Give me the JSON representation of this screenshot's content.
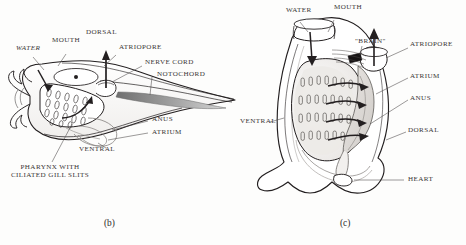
{
  "figure": {
    "panels": [
      {
        "id": "b",
        "caption": "(b)",
        "orientation": "lateral view",
        "labels": [
          {
            "name": "water",
            "text": "WATER",
            "style": "italic"
          },
          {
            "name": "mouth",
            "text": "MOUTH",
            "style": "normal"
          },
          {
            "name": "dorsal",
            "text": "DORSAL",
            "style": "normal"
          },
          {
            "name": "atriopore",
            "text": "ATRIOPORE",
            "style": "normal"
          },
          {
            "name": "nerve-cord",
            "text": "NERVE CORD",
            "style": "normal"
          },
          {
            "name": "notochord",
            "text": "NOTOCHORD",
            "style": "normal"
          },
          {
            "name": "anus",
            "text": "ANUS",
            "style": "normal"
          },
          {
            "name": "atrium",
            "text": "ATRIUM",
            "style": "normal"
          },
          {
            "name": "ventral",
            "text": "VENTRAL",
            "style": "normal"
          },
          {
            "name": "pharynx",
            "text": "PHARYNX WITH CILIATED GILL SLITS",
            "style": "normal"
          }
        ],
        "gill_slit_rows": 4,
        "gill_slits_per_row": 5
      },
      {
        "id": "c",
        "caption": "(c)",
        "orientation": "anterior view",
        "labels": [
          {
            "name": "water",
            "text": "WATER",
            "style": "normal"
          },
          {
            "name": "mouth",
            "text": "MOUTH",
            "style": "normal"
          },
          {
            "name": "brain",
            "text": "\"BRAIN\"",
            "style": "normal"
          },
          {
            "name": "atriopore",
            "text": "ATRIOPORE",
            "style": "normal"
          },
          {
            "name": "atrium",
            "text": "ATRIUM",
            "style": "normal"
          },
          {
            "name": "anus",
            "text": "ANUS",
            "style": "normal"
          },
          {
            "name": "ventral",
            "text": "VENTRAL",
            "style": "normal"
          },
          {
            "name": "dorsal",
            "text": "DORSAL",
            "style": "normal"
          },
          {
            "name": "heart",
            "text": "HEART",
            "style": "normal"
          }
        ],
        "gill_slit_rows": 4,
        "gill_slits_per_row": 7,
        "flow_arrows": 4
      }
    ],
    "colors": {
      "ink": "#231f20",
      "label_ink": "#3a3636",
      "notochord_fill": "#8d8d8d",
      "body_fill": "#ffffff",
      "shade_fill": "#d8d5d2",
      "background": "#fdfdfc"
    }
  }
}
